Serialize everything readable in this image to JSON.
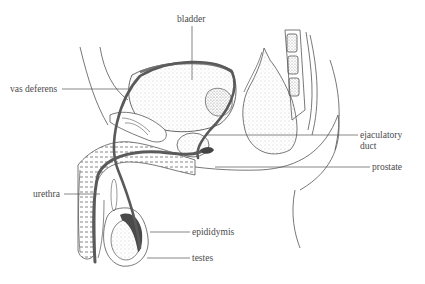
{
  "diagram": {
    "colors": {
      "line": "#555555",
      "duct": "#5a5a5a",
      "stipple": "#9a9a9a",
      "background": "#ffffff"
    },
    "labels": [
      {
        "id": "bladder",
        "text": "bladder"
      },
      {
        "id": "vas_deferens",
        "text": "vas deferens"
      },
      {
        "id": "ejaculatory_duct",
        "text": "ejaculatory duct",
        "lines": [
          "ejaculatory",
          "duct"
        ]
      },
      {
        "id": "prostate",
        "text": "prostate"
      },
      {
        "id": "urethra",
        "text": "urethra"
      },
      {
        "id": "epididymis",
        "text": "epididymis"
      },
      {
        "id": "testes",
        "text": "testes"
      }
    ]
  }
}
